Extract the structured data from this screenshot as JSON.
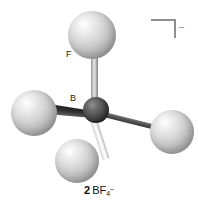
{
  "figure": {
    "kind": "ball-and-stick-molecular-model",
    "caption": {
      "number": "2",
      "formula_core": "BF",
      "subscript": "4",
      "superscript": "–",
      "full_text": "2 BF4–"
    },
    "charge_bracket": {
      "icon": "bracket-corner-icon",
      "charge_label": "–"
    },
    "labels": {
      "fluorine": "F",
      "boron": "B"
    },
    "atoms": [
      {
        "id": "f-top",
        "element": "F",
        "label": "F",
        "color": "#d8d8d8",
        "position": "top"
      },
      {
        "id": "f-left",
        "element": "F",
        "label": "",
        "color": "#d8d8d8",
        "position": "left"
      },
      {
        "id": "f-right",
        "element": "F",
        "label": "",
        "color": "#d8d8d8",
        "position": "right"
      },
      {
        "id": "f-bottom",
        "element": "F",
        "label": "",
        "color": "#d8d8d8",
        "position": "bottom-front"
      },
      {
        "id": "b-center",
        "element": "B",
        "label": "B",
        "color": "#4a4a4a",
        "position": "center"
      }
    ],
    "bonds": [
      {
        "id": "b-f-top",
        "from": "b-center",
        "to": "f-top",
        "style": "cylinder",
        "color": "#c9c9c9"
      },
      {
        "id": "b-f-left",
        "from": "b-center",
        "to": "f-left",
        "style": "wedge-dark",
        "color": "#2e2e2e"
      },
      {
        "id": "b-f-right",
        "from": "b-center",
        "to": "f-right",
        "style": "line-dark",
        "color": "#4a4a4a"
      },
      {
        "id": "b-f-bottom",
        "from": "b-center",
        "to": "f-bottom",
        "style": "cylinder-light",
        "color": "#f2f2f2"
      }
    ],
    "colors": {
      "background": "#ffffff",
      "fluorine": "#d8d8d8",
      "boron": "#4a4a4a",
      "bracket": "#8e8e8e",
      "text": "#111111"
    }
  }
}
